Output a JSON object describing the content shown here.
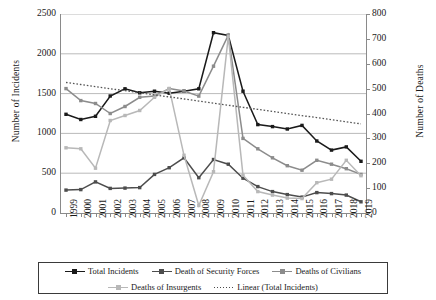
{
  "chart_data": {
    "type": "line",
    "title": "",
    "xlabel": "",
    "ylabel": "Number of Incidents",
    "y2label": "Number of Deaths",
    "grid": true,
    "legend_position": "bottom",
    "ylim": [
      0,
      2500
    ],
    "y2lim": [
      0,
      800
    ],
    "yticks": [
      0,
      500,
      1000,
      1500,
      2000,
      2500
    ],
    "y2ticks": [
      0,
      100,
      200,
      300,
      400,
      500,
      600,
      700,
      800
    ],
    "categories": [
      "1999",
      "2000",
      "2001",
      "2002",
      "2003",
      "2004",
      "2005",
      "2006",
      "2007",
      "2008",
      "2009",
      "2010",
      "2011",
      "2012",
      "2013",
      "2014",
      "2015",
      "2016",
      "2017",
      "2018",
      "2019"
    ],
    "series": [
      {
        "name": "Total Incidents",
        "axis": "left",
        "color": "#1a1a1a",
        "values": [
          1240,
          1175,
          1215,
          1470,
          1560,
          1510,
          1530,
          1505,
          1530,
          1560,
          2265,
          2230,
          1530,
          1110,
          1085,
          1055,
          1100,
          905,
          790,
          830,
          650
        ]
      },
      {
        "name": "Death of Security Forces",
        "axis": "right",
        "color": "#4d4d4d",
        "values": [
          92,
          94,
          125,
          99,
          100,
          102,
          155,
          182,
          222,
          142,
          215,
          196,
          140,
          106,
          86,
          74,
          64,
          82,
          78,
          72,
          45
        ]
      },
      {
        "name": "Deaths of Civilians",
        "axis": "right",
        "color": "#8c8c8c",
        "values": [
          500,
          452,
          440,
          400,
          428,
          465,
          470,
          500,
          490,
          470,
          590,
          715,
          300,
          258,
          222,
          190,
          172,
          212,
          196,
          178,
          155
        ]
      },
      {
        "name": "Deaths of Insurgents",
        "axis": "right",
        "color": "#b8b8b8",
        "values": [
          262,
          258,
          180,
          372,
          392,
          412,
          465,
          500,
          232,
          30,
          166,
          710,
          152,
          86,
          72,
          60,
          58,
          122,
          136,
          212,
          150
        ]
      },
      {
        "name": "Linear (Total Incidents)",
        "axis": "left",
        "color": "#555555",
        "dashed": true,
        "values": [
          1640,
          1614,
          1588,
          1562,
          1536,
          1510,
          1484,
          1458,
          1432,
          1406,
          1380,
          1354,
          1328,
          1302,
          1276,
          1250,
          1224,
          1198,
          1172,
          1146,
          1120
        ]
      }
    ]
  },
  "legend": {
    "items": [
      {
        "label": "Total Incidents"
      },
      {
        "label": "Death of Security Forces"
      },
      {
        "label": "Deaths of Civilians"
      },
      {
        "label": "Deaths of Insurgents"
      },
      {
        "label": "Linear (Total Incidents)"
      }
    ]
  }
}
